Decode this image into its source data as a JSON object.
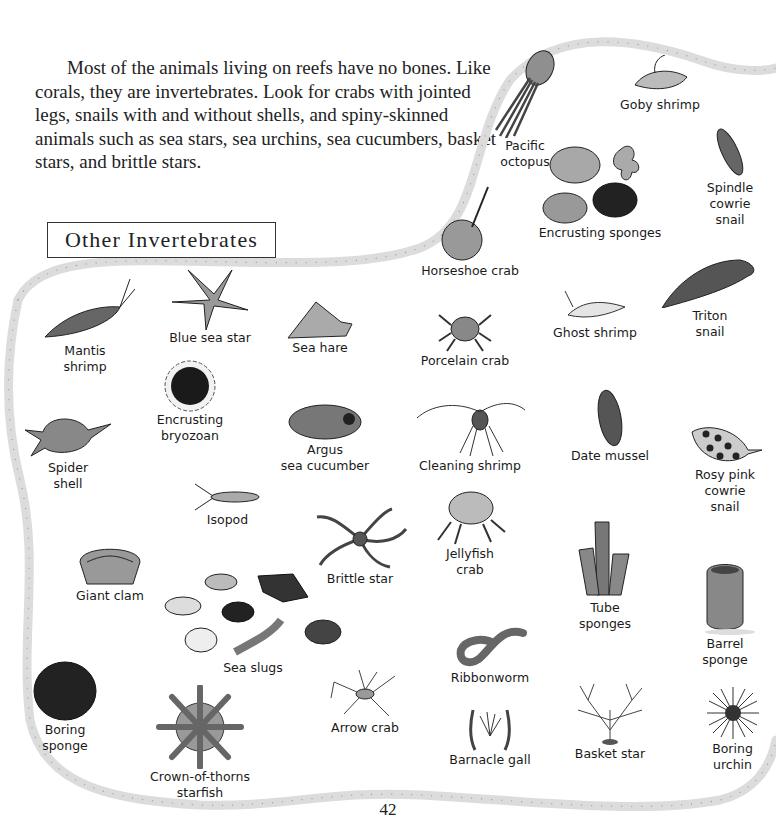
{
  "intro": "Most of the animals living on reefs have no bones. Like corals, they are invertebrates. Look for crabs with jointed legs, snails with and without shells, and spiny-skinned animals such as sea stars, sea urchins, sea cucumbers, basket stars, and brittle stars.",
  "section_title": "Other Invertebrates",
  "page_number": "42",
  "animals": {
    "pacific_octopus": "Pacific\noctopus",
    "goby_shrimp": "Goby shrimp",
    "spindle_cowrie": "Spindle\ncowrie\nsnail",
    "encrusting_sponges": "Encrusting sponges",
    "horseshoe_crab": "Horseshoe crab",
    "triton_snail": "Triton\nsnail",
    "ghost_shrimp": "Ghost shrimp",
    "porcelain_crab": "Porcelain crab",
    "mantis_shrimp": "Mantis\nshrimp",
    "blue_sea_star": "Blue sea star",
    "sea_hare": "Sea hare",
    "encrusting_bryozoan": "Encrusting\nbryozoan",
    "spider_shell": "Spider\nshell",
    "argus_sea_cucumber": "Argus\nsea cucumber",
    "cleaning_shrimp": "Cleaning shrimp",
    "date_mussel": "Date mussel",
    "rosy_pink_cowrie": "Rosy pink\ncowrie\nsnail",
    "isopod": "Isopod",
    "brittle_star": "Brittle star",
    "jellyfish_crab": "Jellyfish\ncrab",
    "giant_clam": "Giant clam",
    "sea_slugs": "Sea slugs",
    "tube_sponges": "Tube\nsponges",
    "barrel_sponge": "Barrel\nsponge",
    "ribbonworm": "Ribbonworm",
    "boring_sponge": "Boring\nsponge",
    "arrow_crab": "Arrow crab",
    "crown_of_thorns": "Crown-of-thorns\nstarfish",
    "barnacle_gall": "Barnacle gall",
    "basket_star": "Basket star",
    "boring_urchin": "Boring\nurchin"
  },
  "colors": {
    "border": "#dcdcdc",
    "ink": "#1a1a1a",
    "shade": "#8a8a8a"
  }
}
